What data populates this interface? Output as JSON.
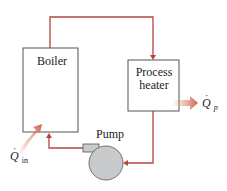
{
  "diagram": {
    "boiler_label": "Boiler",
    "process_heater_label_line1": "Process",
    "process_heater_label_line2": "heater",
    "pump_label": "Pump",
    "heat_in_symbol": "Q",
    "heat_in_subscript": "in",
    "heat_out_symbol": "Q",
    "heat_out_subscript": "p"
  },
  "colors": {
    "pipe": "#b5463e",
    "heat_arrow": "#d9735f",
    "box_border": "#555555",
    "pump_fill": "#c8cacb"
  }
}
